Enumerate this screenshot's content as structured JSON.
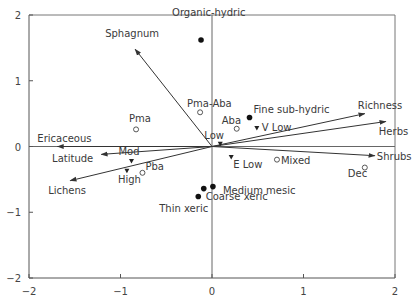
{
  "chart_data": {
    "type": "scatter",
    "title": "",
    "xlabel": "",
    "ylabel": "",
    "xlim": [
      -2,
      2
    ],
    "ylim": [
      -2,
      2
    ],
    "x_ticks": [
      "-2",
      "-1",
      "0",
      "1",
      "2"
    ],
    "y_ticks": [
      "2",
      "1",
      "0",
      "-1",
      "-2"
    ],
    "grid": false,
    "reference_lines": {
      "x": 0,
      "y": 0
    },
    "vectors": [
      {
        "label": "Sphagnum",
        "x": -0.84,
        "y": 1.48
      },
      {
        "label": "Richness",
        "x": 1.67,
        "y": 0.5
      },
      {
        "label": "Herbs",
        "x": 1.9,
        "y": 0.38
      },
      {
        "label": "Shrubs",
        "x": 1.78,
        "y": -0.14
      },
      {
        "label": "Ericaceous",
        "x": -1.69,
        "y": 0.0
      },
      {
        "label": "Latitude",
        "x": -1.21,
        "y": -0.12
      },
      {
        "label": "Lichens",
        "x": -1.55,
        "y": -0.52
      }
    ],
    "series": [
      {
        "name": "Soil type",
        "marker": "filled-circle",
        "points": [
          {
            "label": "Organic-hydric",
            "x": -0.12,
            "y": 1.62
          },
          {
            "label": "Fine sub-hydric",
            "x": 0.41,
            "y": 0.44
          },
          {
            "label": "Medium mesic",
            "x": 0.01,
            "y": -0.61
          },
          {
            "label": "Coarse xeric",
            "x": -0.09,
            "y": -0.64
          },
          {
            "label": "Thin xeric",
            "x": -0.15,
            "y": -0.76
          }
        ]
      },
      {
        "name": "Forest type",
        "marker": "open-circle",
        "points": [
          {
            "label": "Pma-Aba",
            "x": -0.13,
            "y": 0.52
          },
          {
            "label": "Pma",
            "x": -0.83,
            "y": 0.26
          },
          {
            "label": "Aba",
            "x": 0.27,
            "y": 0.27
          },
          {
            "label": "Mixed",
            "x": 0.71,
            "y": -0.2
          },
          {
            "label": "Pba",
            "x": -0.76,
            "y": -0.4
          },
          {
            "label": "Dec",
            "x": 1.67,
            "y": -0.32
          }
        ]
      },
      {
        "name": "Disturbance",
        "marker": "filled-triangle-down",
        "points": [
          {
            "label": "V Low",
            "x": 0.49,
            "y": 0.28
          },
          {
            "label": "Low",
            "x": 0.09,
            "y": 0.04
          },
          {
            "label": "E Low",
            "x": 0.21,
            "y": -0.16
          },
          {
            "label": "Mod",
            "x": -0.88,
            "y": -0.22
          },
          {
            "label": "High",
            "x": -0.93,
            "y": -0.37
          }
        ]
      }
    ]
  }
}
